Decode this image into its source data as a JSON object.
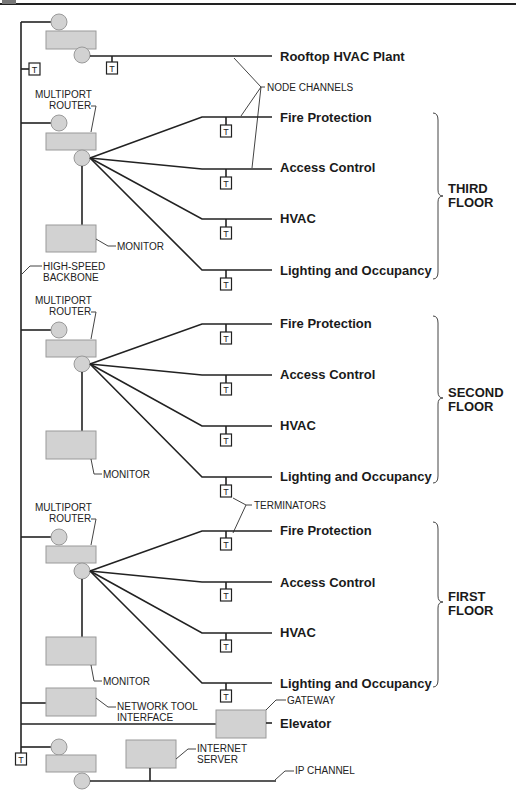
{
  "diagram": {
    "top_channel": {
      "label": "Rooftop HVAC Plant"
    },
    "labels": {
      "node_channels": "NODE CHANNELS",
      "multiport_router_1": "MULTIPORT",
      "multiport_router_2": "ROUTER",
      "monitor": "MONITOR",
      "backbone_1": "HIGH-SPEED",
      "backbone_2": "BACKBONE",
      "terminators": "TERMINATORS",
      "network_tool_1": "NETWORK TOOL",
      "network_tool_2": "INTERFACE",
      "gateway": "GATEWAY",
      "internet_server_1": "INTERNET",
      "internet_server_2": "SERVER",
      "ip_channel": "IP CHANNEL",
      "terminator_glyph": "T"
    },
    "floors": [
      {
        "name_1": "THIRD",
        "name_2": "FLOOR",
        "channels": [
          "Fire Protection",
          "Access Control",
          "HVAC",
          "Lighting and Occupancy"
        ]
      },
      {
        "name_1": "SECOND",
        "name_2": "FLOOR",
        "channels": [
          "Fire Protection",
          "Access Control",
          "HVAC",
          "Lighting and Occupancy"
        ]
      },
      {
        "name_1": "FIRST",
        "name_2": "FLOOR",
        "channels": [
          "Fire Protection",
          "Access Control",
          "HVAC",
          "Lighting and Occupancy"
        ]
      }
    ],
    "elevator": {
      "label": "Elevator"
    },
    "colors": {
      "device_fill": "#d2d2d2",
      "line": "#222222",
      "background": "#ffffff"
    }
  }
}
